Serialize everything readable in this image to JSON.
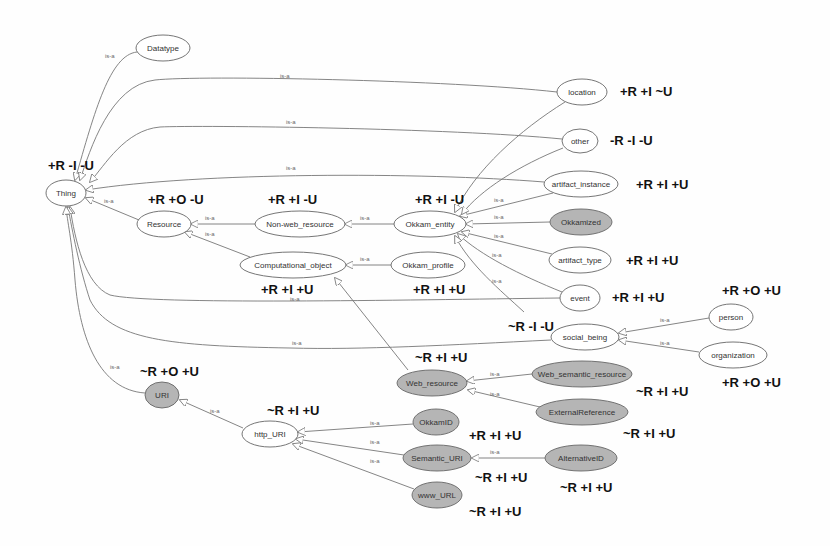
{
  "diagram": {
    "colors": {
      "background": "#fefefe",
      "node_fill_plain": "#ffffff",
      "node_fill_shaded": "#b5b5b5",
      "node_stroke": "#666666",
      "edge": "#777777",
      "annotation": "#111111"
    },
    "edge_label": "is-a",
    "nodes": [
      {
        "id": "Datatype",
        "label": "Datatype",
        "cx": 163,
        "cy": 48,
        "rx": 27,
        "ry": 13,
        "shaded": false
      },
      {
        "id": "Thing",
        "label": "Thing",
        "cx": 66,
        "cy": 193,
        "rx": 20,
        "ry": 13,
        "shaded": false
      },
      {
        "id": "location",
        "label": "location",
        "cx": 582,
        "cy": 92,
        "rx": 25,
        "ry": 13,
        "shaded": false
      },
      {
        "id": "other",
        "label": "other",
        "cx": 580,
        "cy": 141,
        "rx": 18,
        "ry": 12,
        "shaded": false
      },
      {
        "id": "artifact_instance",
        "label": "artifact_instance",
        "cx": 581,
        "cy": 184,
        "rx": 37,
        "ry": 13,
        "shaded": false
      },
      {
        "id": "Resource",
        "label": "Resource",
        "cx": 164,
        "cy": 224,
        "rx": 27,
        "ry": 13,
        "shaded": false
      },
      {
        "id": "Non-web_resource",
        "label": "Non-web_resource",
        "cx": 300,
        "cy": 224,
        "rx": 45,
        "ry": 13,
        "shaded": false
      },
      {
        "id": "Okkam_entity",
        "label": "Okkam_entity",
        "cx": 430,
        "cy": 224,
        "rx": 36,
        "ry": 13,
        "shaded": false
      },
      {
        "id": "Okkamized",
        "label": "Okkamized",
        "cx": 581,
        "cy": 222,
        "rx": 31,
        "ry": 13,
        "shaded": true
      },
      {
        "id": "Computational_object",
        "label": "Computational_object",
        "cx": 293,
        "cy": 265,
        "rx": 53,
        "ry": 13,
        "shaded": false
      },
      {
        "id": "Okkam_profile",
        "label": "Okkam_profile",
        "cx": 428,
        "cy": 265,
        "rx": 37,
        "ry": 13,
        "shaded": false
      },
      {
        "id": "artifact_type",
        "label": "artifact_type",
        "cx": 580,
        "cy": 260,
        "rx": 31,
        "ry": 13,
        "shaded": false
      },
      {
        "id": "event",
        "label": "event",
        "cx": 580,
        "cy": 298,
        "rx": 20,
        "ry": 13,
        "shaded": false
      },
      {
        "id": "person",
        "label": "person",
        "cx": 731,
        "cy": 317,
        "rx": 22,
        "ry": 13,
        "shaded": false
      },
      {
        "id": "social_being",
        "label": "social_being",
        "cx": 585,
        "cy": 337,
        "rx": 34,
        "ry": 13,
        "shaded": false
      },
      {
        "id": "organization",
        "label": "organization",
        "cx": 733,
        "cy": 355,
        "rx": 34,
        "ry": 13,
        "shaded": false
      },
      {
        "id": "Web_semantic_resource",
        "label": "Web_semantic_resource",
        "cx": 582,
        "cy": 374,
        "rx": 50,
        "ry": 13,
        "shaded": true
      },
      {
        "id": "Web_resource",
        "label": "Web_resource",
        "cx": 432,
        "cy": 383,
        "rx": 35,
        "ry": 13,
        "shaded": true
      },
      {
        "id": "URI",
        "label": "URI",
        "cx": 162,
        "cy": 395,
        "rx": 17,
        "ry": 13,
        "shaded": true
      },
      {
        "id": "ExternalReference",
        "label": "ExternalReference",
        "cx": 582,
        "cy": 412,
        "rx": 46,
        "ry": 13,
        "shaded": true
      },
      {
        "id": "http_URI",
        "label": "http_URI",
        "cx": 270,
        "cy": 434,
        "rx": 28,
        "ry": 13,
        "shaded": false
      },
      {
        "id": "OkkamID",
        "label": "OkkamID",
        "cx": 436,
        "cy": 422,
        "rx": 23,
        "ry": 13,
        "shaded": true
      },
      {
        "id": "Semantic_URI",
        "label": "Semantic_URI",
        "cx": 437,
        "cy": 458,
        "rx": 34,
        "ry": 13,
        "shaded": true
      },
      {
        "id": "AlternativeID",
        "label": "AlternativeID",
        "cx": 581,
        "cy": 458,
        "rx": 36,
        "ry": 13,
        "shaded": true
      },
      {
        "id": "www_URL",
        "label": "www_URL",
        "cx": 437,
        "cy": 495,
        "rx": 25,
        "ry": 13,
        "shaded": true
      }
    ],
    "edges": [
      {
        "from": "Datatype",
        "to": "Thing",
        "path": "M137,52 C110,55 95,110 75,180",
        "lx": 105,
        "ly": 58
      },
      {
        "from": "location",
        "to": "Thing",
        "path": "M557,92 C450,80 200,75 155,80 C110,85 90,150 80,180",
        "lx": 280,
        "ly": 78
      },
      {
        "from": "other",
        "to": "Thing",
        "path": "M562,139 C450,128 200,125 160,127 C125,130 105,165 90,182",
        "lx": 286,
        "ly": 124
      },
      {
        "from": "artifact_instance",
        "to": "Thing",
        "path": "M544,182 C420,172 200,172 86,190",
        "lx": 286,
        "ly": 170
      },
      {
        "from": "Resource",
        "to": "Thing",
        "path": "M139,220 L86,198",
        "lx": 104,
        "ly": 203
      },
      {
        "from": "Non-web_resource",
        "to": "Resource",
        "path": "M255,224 L191,224",
        "lx": 205,
        "ly": 220
      },
      {
        "from": "Computational_object",
        "to": "Resource",
        "path": "M250,257 L185,232",
        "lx": 205,
        "ly": 236
      },
      {
        "from": "Okkam_entity",
        "to": "Non-web_resource",
        "path": "M394,224 L345,224",
        "lx": 360,
        "ly": 220
      },
      {
        "from": "Okkam_profile",
        "to": "Computational_object",
        "path": "M391,265 L346,265",
        "lx": 360,
        "ly": 261
      },
      {
        "from": "artifact_instance",
        "to": "Okkam_entity",
        "path": "M553,193 L460,216",
        "lx": 494,
        "ly": 202
      },
      {
        "from": "Okkamized",
        "to": "Okkam_entity",
        "path": "M550,222 L466,224",
        "lx": 494,
        "ly": 219
      },
      {
        "from": "artifact_type",
        "to": "Okkam_entity",
        "path": "M552,254 L462,232",
        "lx": 494,
        "ly": 238
      },
      {
        "from": "event",
        "to": "Okkam_entity",
        "path": "M562,292 C520,275 480,255 458,234",
        "lx": 492,
        "ly": 257
      },
      {
        "from": "social_being",
        "to": "Okkam_entity",
        "path": "M524,312 C500,290 470,265 455,236",
        "lx": 492,
        "ly": 283
      },
      {
        "from": "location",
        "to": "Okkam_entity",
        "path": "M565,102 C520,130 475,170 455,212",
        "lx": 0,
        "ly": 0,
        "nolabel": true
      },
      {
        "from": "other",
        "to": "Okkam_entity",
        "path": "M563,148 C520,165 480,190 462,214",
        "lx": 0,
        "ly": 0,
        "nolabel": true
      },
      {
        "from": "event",
        "to": "Thing",
        "path": "M560,298 C400,300 150,305 110,295 C85,285 75,240 70,207",
        "lx": 290,
        "ly": 301
      },
      {
        "from": "Web_resource",
        "to": "Computational_object",
        "path": "M408,370 L335,278",
        "lx": 0,
        "ly": 0,
        "nolabel": true
      },
      {
        "from": "social_being",
        "to": "Thing",
        "path": "M551,340 C450,345 360,350 290,348 C170,346 110,340 90,300 C80,270 72,230 68,207",
        "lx": 292,
        "ly": 345
      },
      {
        "from": "URI",
        "to": "Thing",
        "path": "M145,393 C100,390 80,340 75,280 C72,240 67,220 66,207",
        "lx": 110,
        "ly": 369
      },
      {
        "from": "person",
        "to": "social_being",
        "path": "M709,318 L619,333",
        "lx": 660,
        "ly": 322
      },
      {
        "from": "organization",
        "to": "social_being",
        "path": "M699,352 L619,340",
        "lx": 660,
        "ly": 345
      },
      {
        "from": "Web_semantic_resource",
        "to": "Web_resource",
        "path": "M532,374 L467,381",
        "lx": 490,
        "ly": 376
      },
      {
        "from": "ExternalReference",
        "to": "Web_resource",
        "path": "M540,407 L468,390",
        "lx": 490,
        "ly": 396
      },
      {
        "from": "http_URI",
        "to": "URI",
        "path": "M243,428 L180,400",
        "lx": 210,
        "ly": 413
      },
      {
        "from": "OkkamID",
        "to": "http_URI",
        "path": "M413,424 L298,432",
        "lx": 370,
        "ly": 425
      },
      {
        "from": "Semantic_URI",
        "to": "http_URI",
        "path": "M404,455 L296,439",
        "lx": 370,
        "ly": 444
      },
      {
        "from": "www_URL",
        "to": "http_URI",
        "path": "M414,489 L293,444",
        "lx": 370,
        "ly": 463
      },
      {
        "from": "AlternativeID",
        "to": "Semantic_URI",
        "path": "M545,458 L472,458",
        "lx": 490,
        "ly": 454
      }
    ],
    "annotations": [
      {
        "for": "Thing",
        "text": "+R -I -U",
        "x": 48,
        "y": 170
      },
      {
        "for": "location",
        "text": "+R +I ~U",
        "x": 620,
        "y": 96
      },
      {
        "for": "other",
        "text": "-R -I -U",
        "x": 610,
        "y": 145
      },
      {
        "for": "artifact_instance",
        "text": "+R +I +U",
        "x": 636,
        "y": 189
      },
      {
        "for": "Resource",
        "text": "+R +O -U",
        "x": 148,
        "y": 204
      },
      {
        "for": "Non-web_resource",
        "text": "+R +I -U",
        "x": 268,
        "y": 204
      },
      {
        "for": "Okkam_entity",
        "text": "+R +I -U",
        "x": 415,
        "y": 204
      },
      {
        "for": "artifact_type",
        "text": "+R +I +U",
        "x": 626,
        "y": 265
      },
      {
        "for": "Computational_object",
        "text": "+R +I +U",
        "x": 261,
        "y": 294
      },
      {
        "for": "Okkam_profile",
        "text": "+R +I +U",
        "x": 413,
        "y": 294
      },
      {
        "for": "event",
        "text": "+R +I +U",
        "x": 612,
        "y": 302
      },
      {
        "for": "person",
        "text": "+R +O +U",
        "x": 722,
        "y": 295
      },
      {
        "for": "social_being",
        "text": "~R -I -U",
        "x": 508,
        "y": 331
      },
      {
        "for": "Web_resource",
        "text": "~R +I +U",
        "x": 415,
        "y": 362
      },
      {
        "for": "organization",
        "text": "+R +O +U",
        "x": 722,
        "y": 387
      },
      {
        "for": "Web_semantic_resource",
        "text": "~R +I +U",
        "x": 636,
        "y": 396
      },
      {
        "for": "URI",
        "text": "~R +O +U",
        "x": 140,
        "y": 376
      },
      {
        "for": "http_URI",
        "text": "~R +I +U",
        "x": 267,
        "y": 415
      },
      {
        "for": "ExternalReference",
        "text": "~R +I +U",
        "x": 623,
        "y": 438
      },
      {
        "for": "OkkamID",
        "text": "+R +I +U",
        "x": 469,
        "y": 440
      },
      {
        "for": "Semantic_URI",
        "text": "~R +I +U",
        "x": 475,
        "y": 482
      },
      {
        "for": "AlternativeID",
        "text": "~R +I +U",
        "x": 560,
        "y": 492
      },
      {
        "for": "www_URL",
        "text": "~R +I +U",
        "x": 469,
        "y": 516
      }
    ]
  }
}
